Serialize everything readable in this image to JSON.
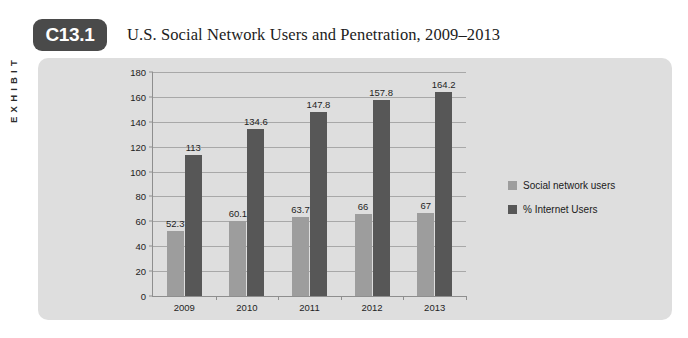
{
  "exhibit": {
    "side_label": "EXHIBIT",
    "badge": "C13.1"
  },
  "title": "U.S. Social Network Users and Penetration, 2009–2013",
  "legend": {
    "position": "right",
    "items": [
      {
        "label": "Social network users",
        "color": "#9d9d9d"
      },
      {
        "label": "% Internet Users",
        "color": "#575757"
      }
    ]
  },
  "chart_data": {
    "type": "bar",
    "title": "U.S. Social Network Users and Penetration, 2009–2013",
    "xlabel": "",
    "ylabel": "",
    "categories": [
      "2009",
      "2010",
      "2011",
      "2012",
      "2013"
    ],
    "series": [
      {
        "name": "Social network users",
        "color": "#9d9d9d",
        "values": [
          52.3,
          60.1,
          63.7,
          66,
          67
        ],
        "labels": [
          "52.3",
          "60.1",
          "63.7",
          "66",
          "67"
        ]
      },
      {
        "name": "% Internet Users",
        "color": "#575757",
        "values": [
          113,
          134.6,
          147.8,
          157.8,
          164.2
        ],
        "labels": [
          "113",
          "134.6",
          "147.8",
          "157.8",
          "164.2"
        ]
      }
    ],
    "ylim": [
      0,
      180
    ],
    "yticks": [
      0,
      20,
      40,
      60,
      80,
      100,
      120,
      140,
      160,
      180
    ],
    "ytick_labels": [
      "0",
      "20",
      "40",
      "60",
      "80",
      "100",
      "120",
      "140",
      "160",
      "180"
    ],
    "grid": true,
    "grid_axis": "y",
    "legend_position": "right",
    "panel_background": "#dedede"
  }
}
